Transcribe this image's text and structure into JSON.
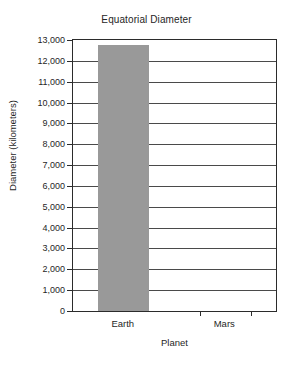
{
  "chart_data": {
    "type": "bar",
    "title": "Equatorial Diameter",
    "xlabel": "Planet",
    "ylabel": "Diameter (kilometers)",
    "categories": [
      "Earth",
      "Mars"
    ],
    "values": [
      12750,
      0
    ],
    "ylim": [
      0,
      13000
    ],
    "ytick_interval": 1000,
    "yticks": [
      0,
      1000,
      2000,
      3000,
      4000,
      5000,
      6000,
      7000,
      8000,
      9000,
      10000,
      11000,
      12000,
      13000
    ],
    "ytick_labels": [
      "0",
      "1,000",
      "2,000",
      "3,000",
      "4,000",
      "5,000",
      "6,000",
      "7,000",
      "8,000",
      "9,000",
      "10,000",
      "11,000",
      "12,000",
      "13,000"
    ],
    "grid": true,
    "grid_axis": "y",
    "legend": false,
    "bar_color": "#999999",
    "frame_color": "#2b2b2b",
    "background_color": "#ffffff"
  },
  "labels": {
    "title": "Equatorial Diameter",
    "x_axis_title": "Planet",
    "y_axis_title": "Diameter (kilometers)",
    "category_earth": "Earth",
    "category_mars": "Mars"
  },
  "y_ticks": [
    {
      "value": 13000,
      "label": "13,000"
    },
    {
      "value": 12000,
      "label": "12,000"
    },
    {
      "value": 11000,
      "label": "11,000"
    },
    {
      "value": 10000,
      "label": "10,000"
    },
    {
      "value": 9000,
      "label": "9,000"
    },
    {
      "value": 8000,
      "label": "8,000"
    },
    {
      "value": 7000,
      "label": "7,000"
    },
    {
      "value": 6000,
      "label": "6,000"
    },
    {
      "value": 5000,
      "label": "5,000"
    },
    {
      "value": 4000,
      "label": "4,000"
    },
    {
      "value": 3000,
      "label": "3,000"
    },
    {
      "value": 2000,
      "label": "2,000"
    },
    {
      "value": 1000,
      "label": "1,000"
    },
    {
      "value": 0,
      "label": "0"
    }
  ]
}
